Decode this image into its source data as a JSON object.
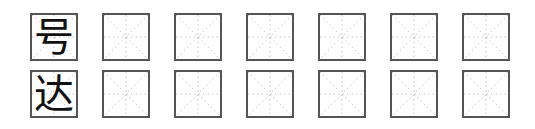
{
  "worksheet": {
    "grid_style": "米字格",
    "rows": [
      {
        "character": "号",
        "practice_cells": 6
      },
      {
        "character": "达",
        "practice_cells": 6
      }
    ],
    "colors": {
      "border": "#555555",
      "guide": "#b0b0b0",
      "text": "#111111"
    }
  }
}
